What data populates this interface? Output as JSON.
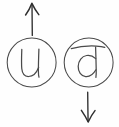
{
  "figure": {
    "title": "Rotation pair diagram",
    "description": "Two hand-drawn circled letters with direction arrows",
    "background_color": "#fefefe",
    "ink_color": "#4a4a4a",
    "arrow_color": "#2e2e2e",
    "width": 119,
    "height": 127
  },
  "nodes": [
    {
      "id": "left",
      "glyph": "u",
      "glyph_name": "letter-u",
      "has_overbar": false,
      "rotation_degrees": 0,
      "center_x": 31.5,
      "center_y": 62.5,
      "radius": 24.5,
      "arrow": {
        "name": "up-arrow",
        "direction": "up",
        "symbol": "↑",
        "x": 32,
        "y_start": 35,
        "y_end": 3
      }
    },
    {
      "id": "right",
      "glyph": "d",
      "glyph_name": "letter-u-rotated",
      "has_overbar": true,
      "rotation_degrees": 180,
      "center_x": 88.5,
      "center_y": 62.5,
      "radius": 24.5,
      "arrow": {
        "name": "down-arrow",
        "direction": "down",
        "symbol": "↓",
        "x": 88,
        "y_start": 92,
        "y_end": 122
      }
    }
  ]
}
